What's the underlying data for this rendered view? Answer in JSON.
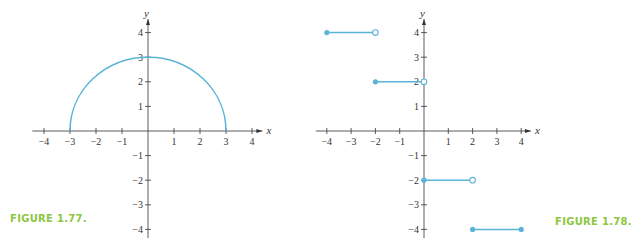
{
  "colors": {
    "curve": "#5ab4d6",
    "axis": "#333333",
    "caption": "#8dc63f"
  },
  "captions": {
    "left": "FIGURE 1.77.",
    "right": "FIGURE 1.78."
  },
  "chart_data": [
    {
      "type": "line",
      "title": "FIGURE 1.77.",
      "xlabel": "x",
      "ylabel": "y",
      "xlim": [
        -4,
        4
      ],
      "ylim": [
        -4,
        4
      ],
      "xticks": [
        -4,
        -3,
        -2,
        -1,
        1,
        2,
        3,
        4
      ],
      "yticks": [
        -4,
        -3,
        -2,
        -1,
        1,
        2,
        3,
        4
      ],
      "grid": false,
      "series": [
        {
          "name": "upper semicircle y = sqrt(9 - x^2)",
          "x": [
            -3,
            -2,
            -1,
            0,
            1,
            2,
            3
          ],
          "y": [
            0,
            2.24,
            2.83,
            3,
            2.83,
            2.24,
            0
          ]
        }
      ]
    },
    {
      "type": "line",
      "title": "FIGURE 1.78.",
      "xlabel": "x",
      "ylabel": "y",
      "xlim": [
        -4,
        4
      ],
      "ylim": [
        -4,
        4
      ],
      "xticks": [
        -4,
        -3,
        -2,
        -1,
        1,
        2,
        3,
        4
      ],
      "yticks": [
        -4,
        -3,
        -2,
        -1,
        1,
        2,
        3,
        4
      ],
      "grid": false,
      "series": [
        {
          "name": "segment 1",
          "x": [
            -4,
            -2
          ],
          "y": [
            4,
            4
          ],
          "start": "closed",
          "end": "open"
        },
        {
          "name": "segment 2",
          "x": [
            -2,
            0
          ],
          "y": [
            2,
            2
          ],
          "start": "closed",
          "end": "open"
        },
        {
          "name": "segment 3",
          "x": [
            0,
            2
          ],
          "y": [
            -2,
            -2
          ],
          "start": "closed",
          "end": "open"
        },
        {
          "name": "segment 4",
          "x": [
            2,
            4
          ],
          "y": [
            -4,
            -4
          ],
          "start": "closed",
          "end": "closed"
        }
      ]
    }
  ]
}
